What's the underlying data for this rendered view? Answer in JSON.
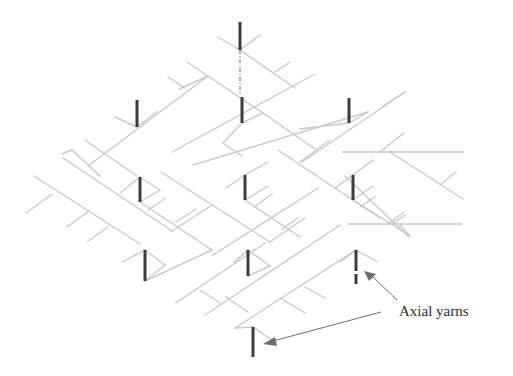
{
  "figure": {
    "background": "#ffffff",
    "colors": {
      "braider_yarn": "#c9c9c9",
      "axial_yarn": "#3c3c3c",
      "leader": "#6e6e6e",
      "label_text": "#2e2e2e"
    }
  },
  "label": {
    "text": "Axial yarns",
    "x": 399,
    "y": 303
  },
  "leaders": [
    {
      "x1": 397,
      "y1": 300,
      "x2": 372,
      "y2": 276,
      "head": [
        [
          364,
          271
        ],
        [
          376,
          274
        ],
        [
          369,
          281
        ]
      ]
    },
    {
      "x1": 381,
      "y1": 312,
      "x2": 273,
      "y2": 341,
      "head": [
        [
          263,
          344
        ],
        [
          275,
          337
        ],
        [
          277,
          346
        ]
      ]
    }
  ],
  "axial_yarns": [
    {
      "x": 240,
      "y1": 22,
      "y2": 50
    },
    {
      "x": 137,
      "y1": 100,
      "y2": 127
    },
    {
      "x": 242,
      "y1": 97,
      "y2": 123
    },
    {
      "x": 349,
      "y1": 98,
      "y2": 123
    },
    {
      "x": 140,
      "y1": 177,
      "y2": 202
    },
    {
      "x": 245,
      "y1": 175,
      "y2": 200
    },
    {
      "x": 353,
      "y1": 175,
      "y2": 200
    },
    {
      "x": 145,
      "y1": 250,
      "y2": 281
    },
    {
      "x": 248,
      "y1": 250,
      "y2": 276
    },
    {
      "x": 356,
      "y1": 250,
      "y2": 271
    },
    {
      "x": 356,
      "y1": 274,
      "y2": 284
    },
    {
      "x": 253,
      "y1": 327,
      "y2": 357
    }
  ],
  "axial_guides": [
    {
      "x": 240,
      "y1": 50,
      "y2": 94
    }
  ],
  "braider_lines": [
    [
      218,
      37,
      240,
      50
    ],
    [
      240,
      50,
      260,
      35
    ],
    [
      240,
      50,
      295,
      88
    ],
    [
      275,
      72,
      290,
      62
    ],
    [
      187,
      62,
      263,
      113
    ],
    [
      168,
      77,
      185,
      88
    ],
    [
      179,
      89,
      208,
      76
    ],
    [
      88,
      166,
      208,
      76
    ],
    [
      115,
      117,
      137,
      127
    ],
    [
      137,
      127,
      158,
      111
    ],
    [
      85,
      140,
      137,
      176
    ],
    [
      62,
      154,
      72,
      150
    ],
    [
      172,
      152,
      315,
      74
    ],
    [
      263,
      113,
      315,
      149
    ],
    [
      193,
      165,
      368,
      112
    ],
    [
      300,
      129,
      349,
      123
    ],
    [
      349,
      123,
      368,
      112
    ],
    [
      223,
      143,
      242,
      123
    ],
    [
      242,
      123,
      263,
      113
    ],
    [
      223,
      143,
      242,
      156
    ],
    [
      100,
      176,
      72,
      150
    ],
    [
      34,
      176,
      140,
      244
    ],
    [
      26,
      213,
      52,
      194
    ],
    [
      67,
      227,
      89,
      211
    ],
    [
      88,
      241,
      108,
      227
    ],
    [
      63,
      158,
      172,
      231
    ],
    [
      120,
      193,
      140,
      177
    ],
    [
      140,
      177,
      160,
      190
    ],
    [
      140,
      202,
      160,
      190
    ],
    [
      140,
      202,
      212,
      250
    ],
    [
      148,
      210,
      166,
      198
    ],
    [
      172,
      231,
      212,
      205
    ],
    [
      176,
      222,
      196,
      209
    ],
    [
      161,
      172,
      270,
      242
    ],
    [
      245,
      175,
      268,
      162
    ],
    [
      226,
      188,
      245,
      175
    ],
    [
      245,
      200,
      268,
      186
    ],
    [
      245,
      200,
      300,
      237
    ],
    [
      254,
      207,
      272,
      194
    ],
    [
      270,
      242,
      305,
      218
    ],
    [
      282,
      229,
      298,
      218
    ],
    [
      278,
      150,
      380,
      218
    ],
    [
      300,
      162,
      330,
      140
    ],
    [
      353,
      175,
      373,
      160
    ],
    [
      335,
      188,
      353,
      175
    ],
    [
      353,
      200,
      373,
      186
    ],
    [
      353,
      200,
      410,
      236
    ],
    [
      360,
      207,
      375,
      197
    ],
    [
      410,
      236,
      400,
      225
    ],
    [
      302,
      162,
      405,
      92
    ],
    [
      342,
      152,
      463,
      152
    ],
    [
      380,
      152,
      404,
      133
    ],
    [
      405,
      92,
      383,
      106
    ],
    [
      390,
      152,
      463,
      199
    ],
    [
      440,
      185,
      456,
      172
    ],
    [
      348,
      224,
      462,
      224
    ],
    [
      388,
      224,
      404,
      212
    ],
    [
      345,
      176,
      408,
      236
    ],
    [
      392,
      224,
      405,
      215
    ],
    [
      213,
      255,
      318,
      188
    ],
    [
      122,
      262,
      145,
      250
    ],
    [
      145,
      250,
      165,
      265
    ],
    [
      145,
      281,
      165,
      265
    ],
    [
      145,
      281,
      212,
      250
    ],
    [
      176,
      303,
      265,
      243
    ],
    [
      200,
      290,
      220,
      303
    ],
    [
      234,
      262,
      248,
      250
    ],
    [
      248,
      250,
      270,
      266
    ],
    [
      248,
      276,
      270,
      266
    ],
    [
      205,
      315,
      340,
      225
    ],
    [
      226,
      297,
      248,
      312
    ],
    [
      235,
      328,
      356,
      250
    ],
    [
      280,
      298,
      305,
      313
    ],
    [
      305,
      287,
      325,
      298
    ],
    [
      356,
      250,
      378,
      262
    ],
    [
      340,
      262,
      356,
      250
    ],
    [
      235,
      328,
      253,
      327
    ],
    [
      253,
      327,
      272,
      340
    ]
  ]
}
